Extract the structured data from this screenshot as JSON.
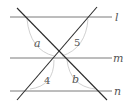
{
  "diagram": {
    "parallel_lines": [
      {
        "id": "l",
        "label": "l",
        "y": 17
      },
      {
        "id": "m",
        "label": "m",
        "y": 58
      },
      {
        "id": "n",
        "label": "n",
        "y": 91
      }
    ],
    "transversals": [
      {
        "id": "t1",
        "x1": 17,
        "y1": 8,
        "x2": 107,
        "y2": 100
      },
      {
        "id": "t2",
        "x1": 97,
        "y1": 7,
        "x2": 17,
        "y2": 100
      }
    ],
    "angle_labels": [
      {
        "id": "a",
        "text": "a",
        "x": 36,
        "y": 47
      },
      {
        "id": "5",
        "text": "5",
        "x": 75,
        "y": 46
      },
      {
        "id": "4",
        "text": "4",
        "x": 45,
        "y": 84
      },
      {
        "id": "b",
        "text": "b",
        "x": 73,
        "y": 83
      }
    ],
    "colors": {
      "line": "#7a7a7a",
      "transversal": "#2b2b2b",
      "arc": "#c4c4c4",
      "text": "#555555"
    }
  }
}
